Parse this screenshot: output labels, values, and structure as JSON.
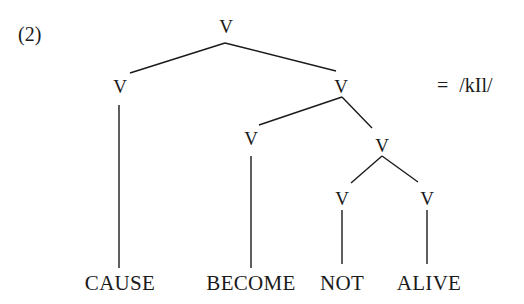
{
  "example_number": "(2)",
  "equation": {
    "equals": "=",
    "phonology": "/kIl/"
  },
  "nodes": {
    "root": "V",
    "cause_v": "V",
    "right_v": "V",
    "become_v": "V",
    "lower_v": "V",
    "not_v": "V",
    "alive_v": "V"
  },
  "terminals": [
    "CAUSE",
    "BECOME",
    "NOT",
    "ALIVE"
  ],
  "style": {
    "line_color": "#1a1a1a",
    "background": "#ffffff"
  }
}
